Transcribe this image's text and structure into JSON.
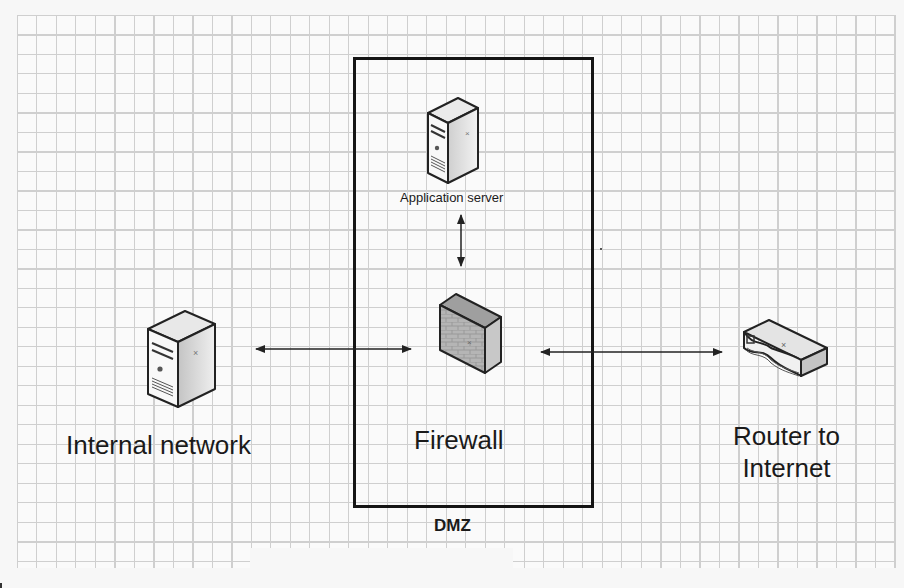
{
  "diagram": {
    "zone": {
      "label": "DMZ"
    },
    "nodes": [
      {
        "id": "app_server",
        "label": "Application server",
        "icon": "server-tower-icon"
      },
      {
        "id": "firewall",
        "label": "Firewall",
        "icon": "firewall-brick-wall-icon"
      },
      {
        "id": "internal",
        "label": "Internal network",
        "icon": "server-tower-icon"
      },
      {
        "id": "router",
        "label_line1": "Router to",
        "label_line2": "Internet",
        "icon": "router-icon"
      }
    ],
    "edges": [
      {
        "from": "app_server",
        "to": "firewall",
        "style": "bidirectional-arrow"
      },
      {
        "from": "internal",
        "to": "firewall",
        "style": "bidirectional-arrow"
      },
      {
        "from": "firewall",
        "to": "router",
        "style": "bidirectional-arrow"
      }
    ],
    "colors": {
      "border": "#151515",
      "grid": "#c9c9c9",
      "background": "#fbfbfb",
      "text": "#1a1a1a"
    }
  }
}
